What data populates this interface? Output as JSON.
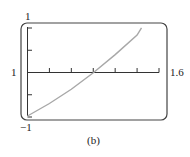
{
  "chart_data": {
    "type": "line",
    "title": "",
    "caption": "(b)",
    "xlabel": "",
    "ylabel": "",
    "xlim": [
      1,
      1.6
    ],
    "ylim": [
      -1,
      1
    ],
    "x_tick_labels": [
      "1",
      "1.6"
    ],
    "y_tick_labels": [
      "1",
      "-1"
    ],
    "x_ticks": 6,
    "y_ticks_each_side": 2,
    "grid": false,
    "legend": null,
    "series": [
      {
        "name": "curve",
        "color": "#a8a8a8",
        "x": [
          1.0,
          1.1,
          1.2,
          1.3,
          1.4,
          1.5,
          1.52
        ],
        "y": [
          -1.0,
          -0.72,
          -0.4,
          -0.03,
          0.38,
          0.82,
          0.98
        ]
      }
    ]
  },
  "labels": {
    "y_max": "1",
    "y_min": "−1",
    "x_min": "1",
    "x_max": "1.6",
    "caption": "(b)"
  }
}
